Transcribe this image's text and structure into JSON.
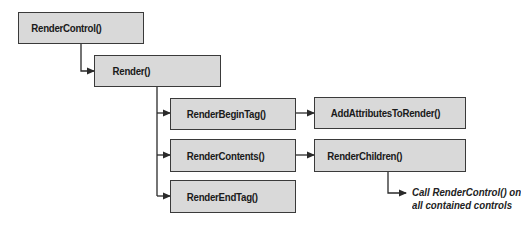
{
  "diagram": {
    "nodes": [
      {
        "id": "render_control",
        "label": "RenderControl()"
      },
      {
        "id": "render",
        "label": "Render()"
      },
      {
        "id": "render_begin_tag",
        "label": "RenderBeginTag()"
      },
      {
        "id": "render_contents",
        "label": "RenderContents()"
      },
      {
        "id": "render_end_tag",
        "label": "RenderEndTag()"
      },
      {
        "id": "add_attributes_to_render",
        "label": "AddAttributesToRender()"
      },
      {
        "id": "render_children",
        "label": "RenderChildren()"
      }
    ],
    "note": {
      "line1": "Call RenderControl() on",
      "line2": "all contained controls"
    },
    "edges": [
      {
        "from": "render_control",
        "to": "render"
      },
      {
        "from": "render",
        "to": "render_begin_tag"
      },
      {
        "from": "render",
        "to": "render_contents"
      },
      {
        "from": "render",
        "to": "render_end_tag"
      },
      {
        "from": "render_begin_tag",
        "to": "add_attributes_to_render"
      },
      {
        "from": "render_contents",
        "to": "render_children"
      },
      {
        "from": "render_children",
        "to": "note"
      }
    ],
    "colors": {
      "box_fill": "#d9d9d9",
      "stroke": "#3a3a3a"
    }
  }
}
